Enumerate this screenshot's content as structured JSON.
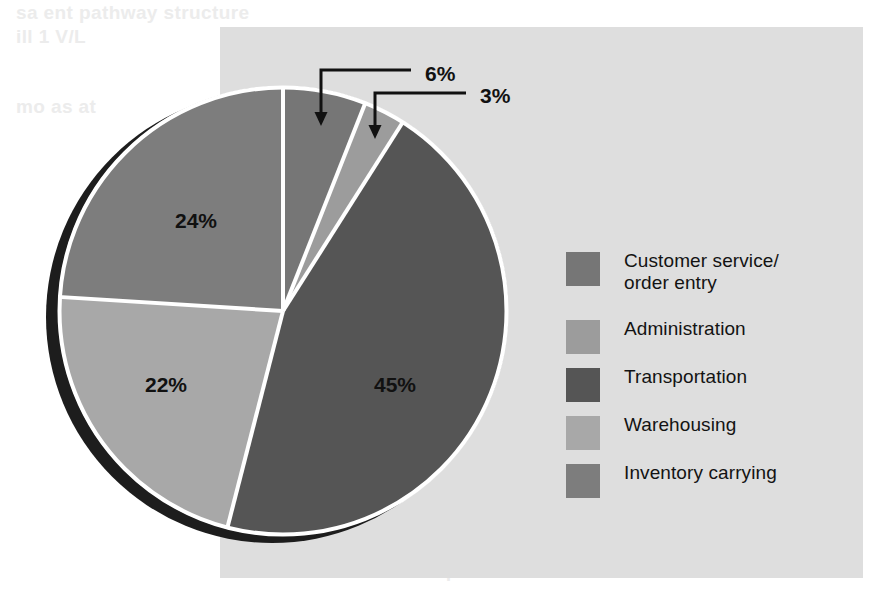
{
  "chart_data": {
    "type": "pie",
    "title": "",
    "categories": [
      "Customer service/order entry",
      "Administration",
      "Transportation",
      "Warehousing",
      "Inventory carrying"
    ],
    "values": [
      6,
      3,
      45,
      22,
      24
    ],
    "value_labels": [
      "6%",
      "3%",
      "45%",
      "22%",
      "24%"
    ],
    "units": "percent",
    "legend_position": "right",
    "start_angle_deg": 0,
    "direction": "clockwise",
    "grid": false,
    "colors": [
      "#767676",
      "#9c9c9c",
      "#555555",
      "#a8a8a8",
      "#7d7d7d"
    ],
    "callout_labels": [
      "6%",
      "3%"
    ],
    "inside_labels": [
      "45%",
      "22%",
      "24%"
    ]
  },
  "panel": {
    "background_color": "#dedede",
    "page_background_color": "#ffffff"
  },
  "pie": {
    "center_x": 283,
    "center_y": 311,
    "radius": 225,
    "separator_color": "#ffffff",
    "shadow_color": "#1d1d1d",
    "slices": [
      {
        "name": "Customer service/order entry",
        "percent": 6,
        "label": "6%",
        "color": "#767676",
        "label_type": "callout"
      },
      {
        "name": "Administration",
        "percent": 3,
        "label": "3%",
        "color": "#9c9c9c",
        "label_type": "callout"
      },
      {
        "name": "Transportation",
        "percent": 45,
        "label": "45%",
        "color": "#555555",
        "label_type": "inside",
        "label_x": 395,
        "label_y": 392
      },
      {
        "name": "Warehousing",
        "percent": 22,
        "label": "22%",
        "color": "#a8a8a8",
        "label_type": "inside",
        "label_x": 166,
        "label_y": 392
      },
      {
        "name": "Inventory carrying",
        "percent": 24,
        "label": "24%",
        "color": "#7d7d7d",
        "label_type": "inside",
        "label_x": 196,
        "label_y": 228
      }
    ]
  },
  "callouts": [
    {
      "label": "6%",
      "text_x": 425,
      "text_y": 81,
      "line_y": 70,
      "line_from_x": 411,
      "line_to_x": 321,
      "arrow_x": 321,
      "arrow_to_y": 126
    },
    {
      "label": "3%",
      "text_x": 480,
      "text_y": 103,
      "line_y": 93,
      "line_from_x": 466,
      "line_to_x": 375,
      "arrow_x": 375,
      "arrow_to_y": 139
    }
  ],
  "legend": {
    "items": [
      {
        "label": "Customer service/\norder entry",
        "color": "#767676",
        "two_line": true
      },
      {
        "label": "Administration",
        "color": "#9c9c9c",
        "two_line": false
      },
      {
        "label": "Transportation",
        "color": "#555555",
        "two_line": false
      },
      {
        "label": "Warehousing",
        "color": "#a8a8a8",
        "two_line": false
      },
      {
        "label": "Inventory carrying",
        "color": "#7d7d7d",
        "two_line": false
      }
    ]
  },
  "scan_artifacts": {
    "ghost_lines": [
      "sa ent pathway structure",
      "ill 1 V/L",
      "mo as at",
      "for abaciadiuquant"
    ]
  }
}
